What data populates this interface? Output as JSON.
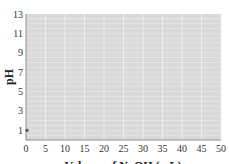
{
  "chart_data": {
    "type": "scatter",
    "title": "",
    "xlabel": "Volume of NaOH (mL)",
    "ylabel": "pH",
    "xlim": [
      0,
      50
    ],
    "ylim": [
      0,
      13
    ],
    "x_ticks": [
      0,
      5,
      10,
      15,
      20,
      25,
      30,
      35,
      40,
      45,
      50
    ],
    "y_ticks": [
      1,
      3,
      5,
      7,
      9,
      11,
      13
    ],
    "grid": true,
    "legend": null,
    "series": [
      {
        "name": "pH",
        "points": [
          {
            "x": 0,
            "y": 1
          }
        ]
      }
    ]
  },
  "colors": {
    "plot_background": "#d9d9d9",
    "grid": "#f2f2f2",
    "axis": "#8c8c8c",
    "point": "#555555"
  }
}
